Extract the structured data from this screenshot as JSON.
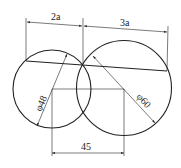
{
  "diagram": {
    "type": "engineering-dimension-drawing",
    "colors": {
      "stroke": "#222222",
      "background": "#ffffff"
    },
    "circles": [
      {
        "name": "left-circle",
        "diameter_label": "φ48"
      },
      {
        "name": "right-circle",
        "diameter_label": "φ60"
      }
    ],
    "dimensions": {
      "top_left": "2a",
      "top_right": "3a",
      "center_distance": "45"
    }
  }
}
